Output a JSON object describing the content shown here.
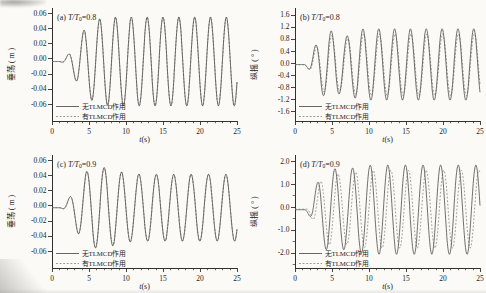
{
  "figure": {
    "background": "#fbfaf7",
    "axis_color": "#30302e",
    "text_color": "#24241f",
    "solid_color": "#56554f",
    "dashed_color": "#8f8d86",
    "xlabel_var": "t",
    "xlabel_unit": "(s)",
    "legend": [
      {
        "label": "无TLMCD作用",
        "style": "solid"
      },
      {
        "label": "有TLMCD作用",
        "style": "dashed"
      }
    ]
  },
  "chart_data": [
    {
      "type": "line",
      "id": "a",
      "tag": "(a)",
      "ratio": "T/T",
      "ratio_sub": "0",
      "ratio_val": "=0.8",
      "ylabel": "垂荡",
      "yunit": "( m )",
      "xlabel": "t(s)",
      "x_range": [
        0,
        25
      ],
      "xticks": [
        0,
        5,
        10,
        15,
        20,
        25
      ],
      "x_minor_step": 1,
      "y_view": [
        -0.0825,
        0.0665
      ],
      "yticks": [
        {
          "v": 0.06,
          "label": "0.06"
        },
        {
          "v": 0.04,
          "label": "0.04"
        },
        {
          "v": 0.02,
          "label": "0.02"
        },
        {
          "v": 0.0,
          "label": "0.00"
        },
        {
          "v": -0.02,
          "label": "-0.02"
        },
        {
          "v": -0.04,
          "label": "-0.04"
        },
        {
          "v": -0.06,
          "label": "-0.06"
        }
      ],
      "y_minor_step": null,
      "series": [
        {
          "name": "无TLMCD作用",
          "style": "solid",
          "steady_amplitude": 0.0585,
          "period": 2.14,
          "peak_time": 4.3,
          "offset": -0.004,
          "ramp_start": 0.9,
          "ramp_tau": 3.1,
          "beat": null
        },
        {
          "name": "有TLMCD作用",
          "style": "dashed",
          "steady_amplitude": 0.0585,
          "period": 2.14,
          "peak_time": 4.3,
          "offset": -0.004,
          "ramp_start": 0.9,
          "ramp_tau": 3.1,
          "beat": null
        }
      ]
    },
    {
      "type": "line",
      "id": "b",
      "tag": "(b)",
      "ratio": "T/T",
      "ratio_sub": "0",
      "ratio_val": "=0.8",
      "ylabel": "纵摇",
      "yunit": "( ° )",
      "xlabel": "t(s)",
      "x_range": [
        0,
        25
      ],
      "xticks": [
        0,
        5,
        10,
        15,
        20,
        25
      ],
      "x_minor_step": 1,
      "y_view": [
        -1.92,
        1.82
      ],
      "yticks": [
        {
          "v": 1.6,
          "label": "1.6"
        },
        {
          "v": 1.2,
          "label": "1.2"
        },
        {
          "v": 0.8,
          "label": "0.8"
        },
        {
          "v": 0.4,
          "label": "0.4"
        },
        {
          "v": 0.0,
          "label": "0.0"
        },
        {
          "v": -0.4,
          "label": "-0.4"
        },
        {
          "v": -0.8,
          "label": "-0.8"
        },
        {
          "v": -1.2,
          "label": "-1.2"
        },
        {
          "v": -1.6,
          "label": "-1.6"
        }
      ],
      "y_minor_step": null,
      "series": [
        {
          "name": "无TLMCD作用",
          "style": "solid",
          "steady_amplitude": 1.18,
          "period": 2.14,
          "peak_time": 4.9,
          "offset": -0.05,
          "ramp_start": 1.1,
          "ramp_tau": 1.9,
          "beat": {
            "depth": -0.22,
            "center": 6.6,
            "width": 1.3
          }
        },
        {
          "name": "有TLMCD作用",
          "style": "dashed",
          "steady_amplitude": 1.02,
          "period": 2.14,
          "peak_time": 4.98,
          "offset": -0.06,
          "ramp_start": 1.1,
          "ramp_tau": 1.9,
          "beat": {
            "depth": -0.18,
            "center": 6.6,
            "width": 1.3
          }
        }
      ]
    },
    {
      "type": "line",
      "id": "c",
      "tag": "(c)",
      "ratio": "T/T",
      "ratio_sub": "0",
      "ratio_val": "=0.9",
      "ylabel": "垂荡",
      "yunit": "( m )",
      "xlabel": "t(s)",
      "x_range": [
        0,
        25
      ],
      "xticks": [
        0,
        5,
        10,
        15,
        20,
        25
      ],
      "x_minor_step": 1,
      "y_view": [
        -0.0825,
        0.0665
      ],
      "yticks": [
        {
          "v": 0.06,
          "label": "0.06"
        },
        {
          "v": 0.04,
          "label": "0.04"
        },
        {
          "v": 0.02,
          "label": "0.02"
        },
        {
          "v": 0.0,
          "label": "0.00"
        },
        {
          "v": -0.02,
          "label": "-0.02"
        },
        {
          "v": -0.04,
          "label": "-0.04"
        },
        {
          "v": -0.06,
          "label": "-0.06"
        }
      ],
      "y_minor_step": null,
      "series": [
        {
          "name": "无TLMCD作用",
          "style": "solid",
          "steady_amplitude": 0.044,
          "period": 2.35,
          "peak_time": 4.7,
          "offset": -0.003,
          "ramp_start": 1.0,
          "ramp_tau": 2.3,
          "beat": {
            "depth": 0.22,
            "center": 6.2,
            "width": 3.0
          }
        },
        {
          "name": "有TLMCD作用",
          "style": "dashed",
          "steady_amplitude": 0.044,
          "period": 2.35,
          "peak_time": 4.7,
          "offset": -0.003,
          "ramp_start": 1.0,
          "ramp_tau": 2.3,
          "beat": {
            "depth": 0.22,
            "center": 6.2,
            "width": 3.0
          }
        }
      ]
    },
    {
      "type": "line",
      "id": "d",
      "tag": "(d)",
      "ratio": "T/T",
      "ratio_sub": "0",
      "ratio_val": "=0.9",
      "ylabel": "纵摇",
      "yunit": "( ° )",
      "xlabel": "t(s)",
      "x_range": [
        0,
        25
      ],
      "xticks": [
        0,
        5,
        10,
        15,
        20,
        25
      ],
      "x_minor_step": 1,
      "y_view": [
        -2.67,
        2.27
      ],
      "yticks": [
        {
          "v": 2.0,
          "label": "2.0"
        },
        {
          "v": 1.0,
          "label": "1.0"
        },
        {
          "v": 0.0,
          "label": "0.0"
        },
        {
          "v": -1.0,
          "label": "-1.0"
        },
        {
          "v": -2.0,
          "label": "-2.0"
        }
      ],
      "y_minor_step": 0.5,
      "series": [
        {
          "name": "无TLMCD作用",
          "style": "solid",
          "steady_amplitude": 1.95,
          "period": 2.38,
          "peak_time": 5.4,
          "offset": -0.12,
          "ramp_start": 1.2,
          "ramp_tau": 1.9,
          "beat": {
            "depth": -0.1,
            "center": 6.5,
            "width": 2.0
          }
        },
        {
          "name": "有TLMCD作用",
          "style": "dashed",
          "steady_amplitude": 1.7,
          "period": 2.38,
          "peak_time": 5.82,
          "offset": -0.1,
          "ramp_start": 1.3,
          "ramp_tau": 1.9,
          "beat": {
            "depth": -0.1,
            "center": 6.5,
            "width": 2.0
          }
        }
      ]
    }
  ]
}
